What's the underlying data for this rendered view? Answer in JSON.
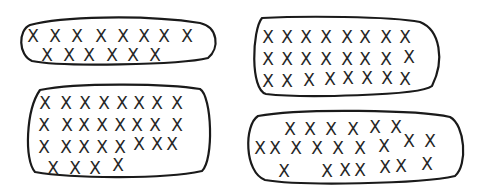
{
  "diagram": {
    "mark_glyph": "X",
    "stroke_color": "#1a1a1a",
    "mark_color": "#262626",
    "background": "#ffffff",
    "groups": [
      {
        "id": "top-left",
        "count": 14,
        "rows": [
          8,
          6
        ],
        "path": "M 30 25 C 60 17, 140 14, 200 23 C 218 27, 220 48, 208 58 C 180 65, 60 67, 32 61 C 18 55, 18 30, 30 25 Z",
        "marks": [
          [
            33,
            36
          ],
          [
            55,
            36
          ],
          [
            77,
            36
          ],
          [
            101,
            36
          ],
          [
            123,
            36
          ],
          [
            144,
            36
          ],
          [
            164,
            36
          ],
          [
            187,
            36
          ],
          [
            47,
            55
          ],
          [
            69,
            55
          ],
          [
            89,
            55
          ],
          [
            112,
            55
          ],
          [
            133,
            55
          ],
          [
            155,
            55
          ]
        ]
      },
      {
        "id": "top-right",
        "count": 24,
        "rows": [
          8,
          8,
          8
        ],
        "path": "M 262 18 C 300 16, 390 16, 420 22 C 440 30, 445 60, 432 86 C 420 96, 300 98, 266 94 C 250 90, 252 30, 262 18 Z",
        "marks": [
          [
            268,
            37
          ],
          [
            287,
            37
          ],
          [
            306,
            37
          ],
          [
            326,
            37
          ],
          [
            347,
            37
          ],
          [
            365,
            37
          ],
          [
            386,
            37
          ],
          [
            405,
            37
          ],
          [
            268,
            59
          ],
          [
            287,
            59
          ],
          [
            306,
            59
          ],
          [
            326,
            59
          ],
          [
            347,
            59
          ],
          [
            365,
            59
          ],
          [
            386,
            59
          ],
          [
            409,
            57
          ],
          [
            268,
            81
          ],
          [
            287,
            81
          ],
          [
            309,
            80
          ],
          [
            330,
            79
          ],
          [
            348,
            78
          ],
          [
            367,
            78
          ],
          [
            387,
            78
          ],
          [
            405,
            79
          ]
        ]
      },
      {
        "id": "bottom-left",
        "count": 28,
        "rows": [
          8,
          8,
          8,
          4
        ],
        "path": "M 40 90 C 80 82, 170 84, 200 89 C 212 96, 214 160, 202 171 C 160 180, 70 178, 35 172 C 24 160, 26 110, 40 90 Z",
        "marks": [
          [
            45,
            103
          ],
          [
            66,
            103
          ],
          [
            85,
            103
          ],
          [
            104,
            103
          ],
          [
            122,
            103
          ],
          [
            139,
            103
          ],
          [
            157,
            103
          ],
          [
            177,
            103
          ],
          [
            44,
            125
          ],
          [
            67,
            125
          ],
          [
            84,
            125
          ],
          [
            102,
            125
          ],
          [
            120,
            125
          ],
          [
            137,
            125
          ],
          [
            155,
            125
          ],
          [
            177,
            125
          ],
          [
            44,
            147
          ],
          [
            66,
            147
          ],
          [
            84,
            147
          ],
          [
            102,
            147
          ],
          [
            120,
            147
          ],
          [
            139,
            144
          ],
          [
            157,
            144
          ],
          [
            172,
            144
          ],
          [
            53,
            168
          ],
          [
            75,
            168
          ],
          [
            95,
            168
          ],
          [
            118,
            165
          ]
        ]
      },
      {
        "id": "bottom-right",
        "count": 22,
        "rows": [
          6,
          9,
          7
        ],
        "path": "M 258 116 C 300 108, 420 110, 450 117 C 465 125, 468 165, 455 176 C 420 184, 300 186, 265 180 C 244 172, 244 125, 258 116 Z",
        "marks": [
          [
            290,
            129
          ],
          [
            310,
            129
          ],
          [
            331,
            129
          ],
          [
            353,
            129
          ],
          [
            375,
            127
          ],
          [
            396,
            127
          ],
          [
            260,
            148
          ],
          [
            275,
            148
          ],
          [
            296,
            148
          ],
          [
            317,
            148
          ],
          [
            338,
            148
          ],
          [
            360,
            148
          ],
          [
            384,
            146
          ],
          [
            409,
            141
          ],
          [
            430,
            141
          ],
          [
            284,
            171
          ],
          [
            327,
            171
          ],
          [
            345,
            170
          ],
          [
            360,
            170
          ],
          [
            385,
            167
          ],
          [
            401,
            166
          ],
          [
            427,
            164
          ]
        ]
      }
    ],
    "total_marks": 88
  }
}
